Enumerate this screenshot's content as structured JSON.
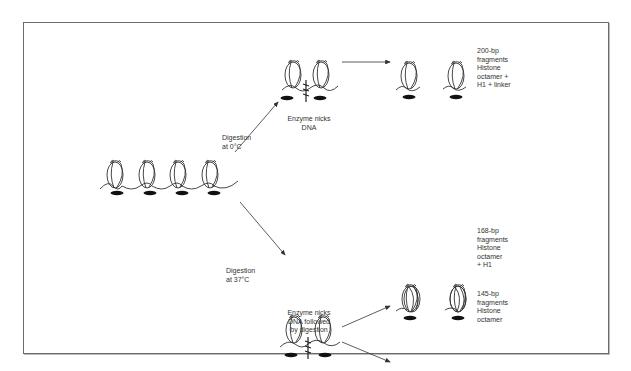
{
  "diagram": {
    "type": "process-flow",
    "start": {
      "label": "",
      "nucleosome_count": 4,
      "has_h1": true
    },
    "branches": [
      {
        "condition_label": "Digestion\nat 0°C",
        "intermediate_label": "Enzyme nicks\nDNA",
        "products": [
          {
            "label": "200-bp\nfragments\nHistone\noctamer +\nH1 + linker",
            "has_h1": true,
            "has_linker": true
          }
        ]
      },
      {
        "condition_label": "Digestion\nat 37°C",
        "intermediate_label": "Enzyme nicks\nDNA followed\nby digestion",
        "products": [
          {
            "label": "168-bp\nfragments\nHistone\noctamer\n+ H1",
            "has_h1": true,
            "has_linker": false
          },
          {
            "label": "145-bp\nfragments\nHistone\noctamer",
            "has_h1": false,
            "has_linker": false
          }
        ]
      }
    ]
  },
  "colors": {
    "line": "#333333",
    "h1": "#111111",
    "frame": "#6b6b6b"
  }
}
